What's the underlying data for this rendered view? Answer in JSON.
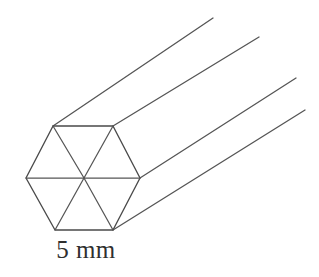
{
  "figure": {
    "background_color": "#ffffff",
    "stroke_color": "#4a4a4a",
    "label": "5 mm",
    "label_text_color": "#2f2f2f",
    "geometry": {
      "shape": "hexagonal-prism",
      "cross_section": "regular-hexagon",
      "internal_divisions": 6,
      "hexagon_vertices": {
        "top_left": [
          53,
          126
        ],
        "top_right": [
          113,
          126
        ],
        "right": [
          140,
          178
        ],
        "bottom_right": [
          113,
          230
        ],
        "bottom_left": [
          55,
          230
        ],
        "left": [
          26,
          178
        ],
        "center": [
          84,
          178
        ]
      },
      "extrusion_lines": [
        {
          "from": [
            53,
            126
          ],
          "to": [
            213,
            18
          ]
        },
        {
          "from": [
            113,
            126
          ],
          "to": [
            259,
            37
          ]
        },
        {
          "from": [
            140,
            178
          ],
          "to": [
            296,
            78
          ]
        },
        {
          "from": [
            113,
            230
          ],
          "to": [
            305,
            110
          ]
        }
      ],
      "dimension_measures_edge": "bottom",
      "dimension_value": "5 mm"
    }
  }
}
